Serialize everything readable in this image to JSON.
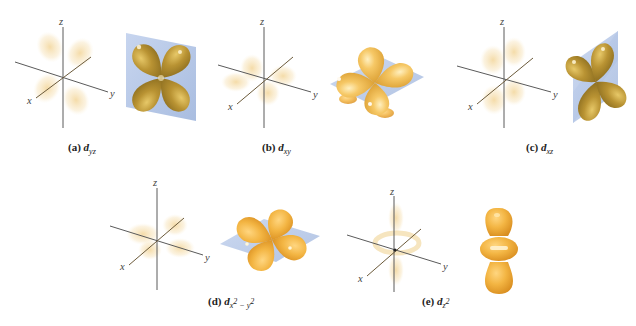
{
  "figure": {
    "colors": {
      "lobe_light": "#f5cc6a",
      "lobe_mid": "#e3a93a",
      "lobe_dark": "#b08a2a",
      "lobe_olive": "#9c7e28",
      "plane": "#b8c8e6",
      "cloud": "#f0d79a",
      "axis": "#5a5a5a"
    },
    "axis_labels": {
      "x": "x",
      "y": "y",
      "z": "z"
    },
    "panels": [
      {
        "id": "a",
        "tag": "(a)",
        "symbol": "d",
        "sub": "yz",
        "sup": "",
        "sub2": "",
        "sup2": "",
        "orbital": "d_yz"
      },
      {
        "id": "b",
        "tag": "(b)",
        "symbol": "d",
        "sub": "xy",
        "sup": "",
        "sub2": "",
        "sup2": "",
        "orbital": "d_xy"
      },
      {
        "id": "c",
        "tag": "(c)",
        "symbol": "d",
        "sub": "xz",
        "sup": "",
        "sub2": "",
        "sup2": "",
        "orbital": "d_xz"
      },
      {
        "id": "d",
        "tag": "(d)",
        "symbol": "d",
        "sub": "x",
        "sup": "2",
        "sub2": " − y",
        "sup2": "2",
        "orbital": "d_x2-y2"
      },
      {
        "id": "e",
        "tag": "(e)",
        "symbol": "d",
        "sub": "z",
        "sup": "2",
        "sub2": "",
        "sup2": "",
        "orbital": "d_z2"
      }
    ]
  }
}
